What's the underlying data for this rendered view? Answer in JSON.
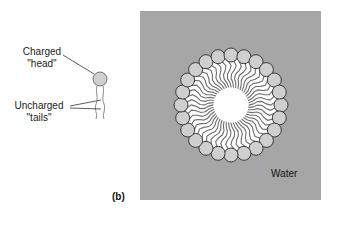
{
  "labels": {
    "charged_line1": "Charged",
    "charged_line2": "\"head\"",
    "uncharged_line1": "Uncharged",
    "uncharged_line2": "\"tails\"",
    "water": "Water",
    "panel": "(b)"
  },
  "colors": {
    "water_background": "#a6a6a6",
    "head_fill": "#cfcfcf",
    "head_stroke": "#3a3a3a",
    "tail_stroke": "#6e6e6e",
    "core": "#ffffff"
  },
  "micelle": {
    "center_x": 231,
    "center_y": 105,
    "head_ring_radius": 50,
    "head_radius": 7,
    "head_count": 24
  },
  "molecule": {
    "head_x": 100,
    "head_y": 79,
    "head_radius": 7
  }
}
